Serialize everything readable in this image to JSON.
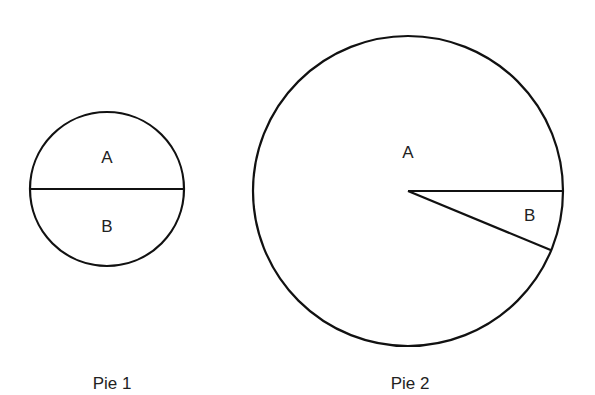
{
  "chart_data": [
    {
      "type": "pie",
      "title": "Pie 1",
      "labels": [
        "A",
        "B"
      ],
      "values": [
        50,
        50
      ],
      "relative_size": "small"
    },
    {
      "type": "pie",
      "title": "Pie 2",
      "labels": [
        "A",
        "B"
      ],
      "values": [
        93.75,
        6.25
      ],
      "relative_size": "large"
    }
  ],
  "colors": {
    "stroke": "#111111",
    "fill": "#ffffff",
    "text": "#222222"
  }
}
